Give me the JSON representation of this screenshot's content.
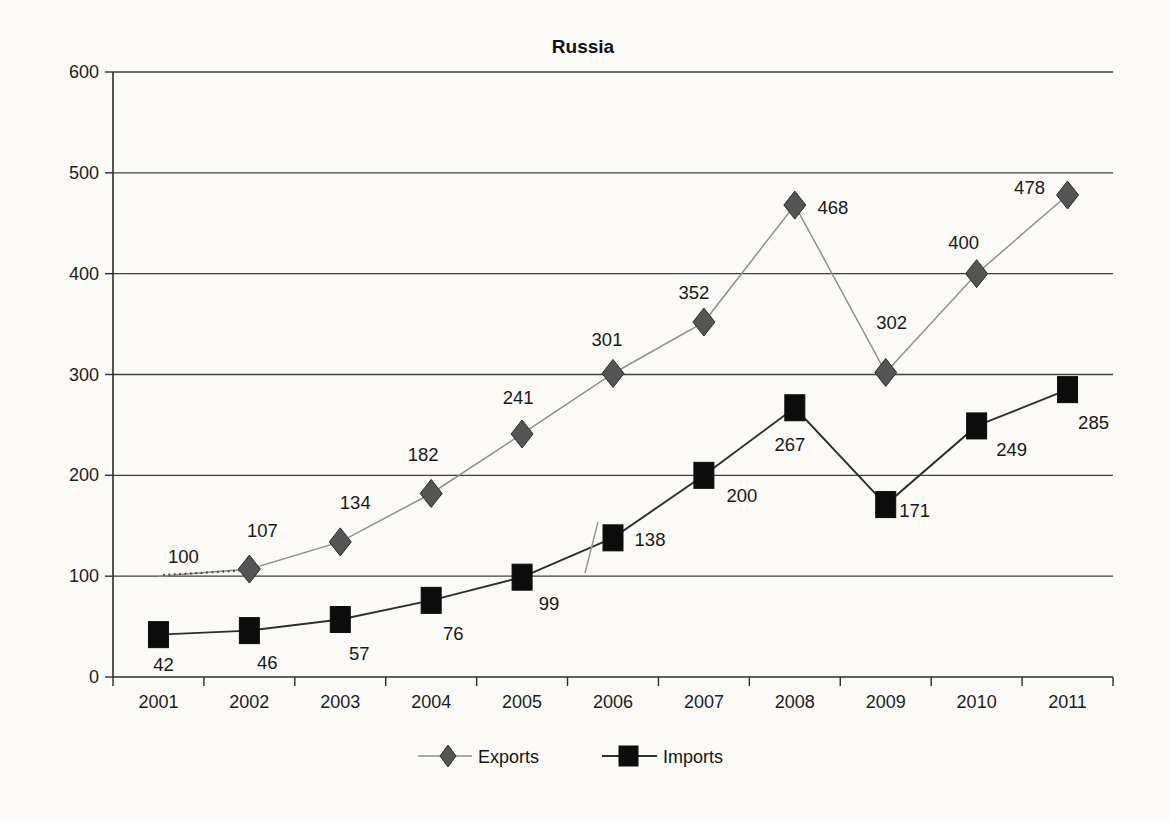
{
  "chart_data": {
    "type": "line",
    "title": "Russia",
    "categories": [
      "2001",
      "2002",
      "2003",
      "2004",
      "2005",
      "2006",
      "2007",
      "2008",
      "2009",
      "2010",
      "2011"
    ],
    "series": [
      {
        "name": "Exports",
        "marker": "diamond",
        "color": "#8f8f8f",
        "marker_color": "#555555",
        "values": [
          100,
          107,
          134,
          182,
          241,
          301,
          352,
          468,
          302,
          400,
          478
        ]
      },
      {
        "name": "Imports",
        "marker": "square",
        "color": "#2e2e2e",
        "marker_color": "#0c0c0c",
        "values": [
          42,
          46,
          57,
          76,
          99,
          138,
          200,
          267,
          171,
          249,
          285
        ]
      }
    ],
    "xlabel": "",
    "ylabel": "",
    "ylim": [
      0,
      600
    ],
    "ytick_step": 100,
    "grid": "horizontal",
    "legend_position": "bottom",
    "layout": {
      "plot": {
        "left": 113,
        "right": 1113,
        "top": 72,
        "bottom": 677
      },
      "hidden_markers": {
        "0": [
          0
        ],
        "1": []
      },
      "label_offsets": {
        "0": [
          [
            25,
            -19
          ],
          [
            13,
            -38
          ],
          [
            15,
            -39
          ],
          [
            -8,
            -38
          ],
          [
            -4,
            -36
          ],
          [
            -6,
            -33
          ],
          [
            -10,
            -29
          ],
          [
            38,
            3
          ],
          [
            6,
            -49
          ],
          [
            -13,
            -31
          ],
          [
            -38,
            -7
          ]
        ],
        "1": [
          [
            5,
            30
          ],
          [
            18,
            32
          ],
          [
            19,
            34
          ],
          [
            22,
            34
          ],
          [
            27,
            27
          ],
          [
            37,
            2
          ],
          [
            38,
            21
          ],
          [
            -5,
            37
          ],
          [
            29,
            6
          ],
          [
            35,
            24
          ],
          [
            26,
            33
          ]
        ]
      }
    }
  },
  "legend": {
    "exports_label": "Exports",
    "imports_label": "Imports"
  },
  "colors": {
    "background": "#fbfaf7",
    "grid": "#3f3f3f",
    "ink": "#1c1c1c"
  }
}
